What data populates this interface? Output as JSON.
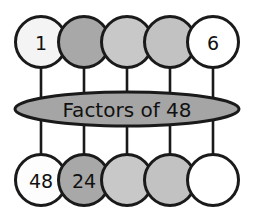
{
  "diagram": {
    "type": "concept-map",
    "center": {
      "label": "Factors of 48",
      "fill": "#a5a5a5",
      "stroke": "#1a1a1a",
      "cx": 127,
      "cy": 109,
      "rx": 113,
      "ry": 17
    },
    "top_row": {
      "cy": 42,
      "r": 26,
      "nodes": [
        {
          "label": "1",
          "fill": "#f4f4f4",
          "cx": 41
        },
        {
          "label": "",
          "fill": "#a8a8a8",
          "cx": 84
        },
        {
          "label": "",
          "fill": "#c8c8c8",
          "cx": 127
        },
        {
          "label": "",
          "fill": "#c2c2c2",
          "cx": 170
        },
        {
          "label": "6",
          "fill": "#ffffff",
          "cx": 213
        }
      ]
    },
    "bottom_row": {
      "cy": 180,
      "r": 26,
      "nodes": [
        {
          "label": "48",
          "fill": "#fdfdfd",
          "cx": 41
        },
        {
          "label": "24",
          "fill": "#a8a8a8",
          "cx": 84
        },
        {
          "label": "",
          "fill": "#c8c8c8",
          "cx": 127
        },
        {
          "label": "",
          "fill": "#c2c2c2",
          "cx": 170
        },
        {
          "label": "",
          "fill": "#ffffff",
          "cx": 213
        }
      ]
    },
    "connectors": {
      "stroke": "#1a1a1a",
      "top_y1": 68,
      "top_y2": 95,
      "bottom_y1": 124,
      "bottom_y2": 154
    },
    "colors": {
      "background": "#ffffff",
      "outline": "#1a1a1a",
      "fill_medium": "#a8a8a8",
      "fill_light": "#c8c8c8",
      "fill_white": "#ffffff"
    }
  }
}
